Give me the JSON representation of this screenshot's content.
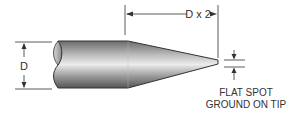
{
  "diagram": {
    "labels": {
      "diameter": "D",
      "taper_length": "D x 2",
      "note_line1": "FLAT SPOT",
      "note_line2": "GROUND ON TIP"
    },
    "colors": {
      "line": "#333333",
      "body_dark": "#5a5a5a",
      "body_light": "#e6e6e6",
      "background": "#ffffff"
    }
  }
}
